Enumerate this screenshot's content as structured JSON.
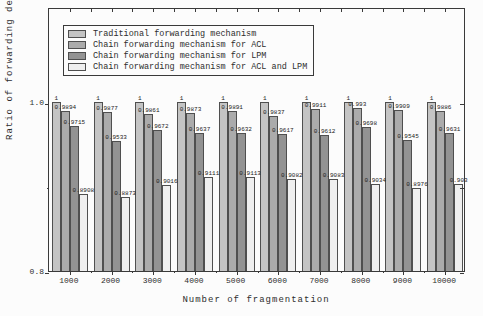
{
  "figure": {
    "x_axis_title": "Number of fragmentation",
    "y_axis_title": "Ratio of forwarding delay",
    "y_tick_labels": [
      "1.0",
      "0.8"
    ]
  },
  "colors": {
    "bar_border": "#4f4f4f",
    "axis": "#3a3a3a",
    "text": "#2e2e2e",
    "background": "#fcfcfc"
  },
  "chart_data": {
    "type": "bar",
    "title": "",
    "xlabel": "Number of fragmentation",
    "ylabel": "Ratio of forwarding delay",
    "ylim": [
      0.8,
      1.112
    ],
    "y_major_ticks": [
      0.8,
      1.0
    ],
    "y_minor_ticks": [
      0.9
    ],
    "grid": false,
    "legend_position": "upper left",
    "categories": [
      "1000",
      "2000",
      "3000",
      "4000",
      "5000",
      "6000",
      "7000",
      "8000",
      "9000",
      "10000"
    ],
    "series": [
      {
        "name": "Traditional forwarding mechanism",
        "short": "traditional",
        "color": "#c4c4c4",
        "values": [
          1,
          1,
          1,
          1,
          1,
          1,
          1,
          1,
          1,
          1
        ]
      },
      {
        "name": "Chain forwarding mechanism for ACL",
        "short": "acl",
        "color": "#ababab",
        "values": [
          0.9894,
          0.9877,
          0.9861,
          0.9873,
          0.9891,
          0.9837,
          0.9911,
          0.993,
          0.9909,
          0.9886
        ]
      },
      {
        "name": "Chain forwarding mechanism for LPM",
        "short": "lpm",
        "color": "#939393",
        "values": [
          0.9715,
          0.9533,
          0.9672,
          0.9637,
          0.9632,
          0.9617,
          0.9612,
          0.9698,
          0.9545,
          0.9631
        ]
      },
      {
        "name": "Chain forwarding mechanism for ACL and LPM",
        "short": "acl-lpm",
        "color": "#efefef",
        "values": [
          0.8908,
          0.8873,
          0.9016,
          0.9111,
          0.9113,
          0.9082,
          0.9083,
          0.9034,
          0.8976,
          0.903
        ]
      }
    ]
  }
}
